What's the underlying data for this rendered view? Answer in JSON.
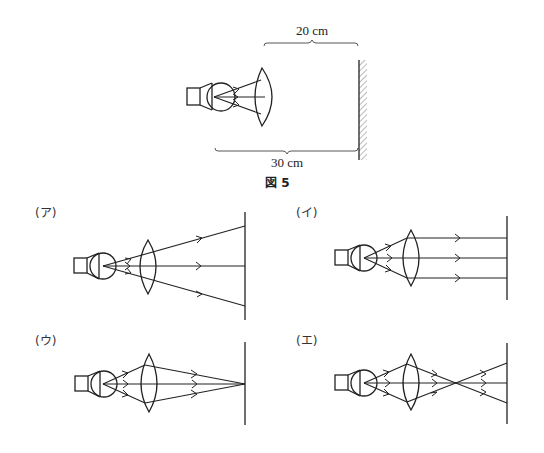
{
  "figure": {
    "caption": "図 5",
    "dimension_top": "20 cm",
    "dimension_bottom": "30 cm"
  },
  "options": [
    {
      "label": "(ア)",
      "description": "Rays diverge after lens to the screen"
    },
    {
      "label": "(イ)",
      "description": "Rays become parallel after lens"
    },
    {
      "label": "(ウ)",
      "description": "Rays converge to a point on the screen"
    },
    {
      "label": "(エ)",
      "description": "Rays converge before screen, then diverge"
    }
  ]
}
